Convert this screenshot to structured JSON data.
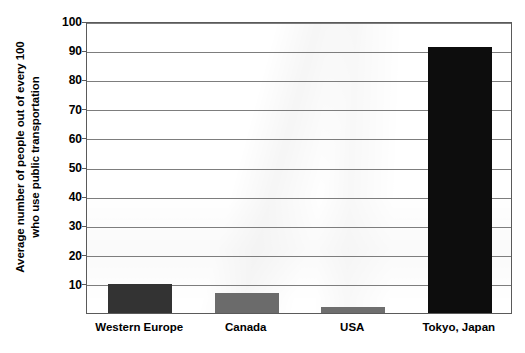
{
  "chart_data": {
    "type": "bar",
    "title": "",
    "subtitle": "",
    "xlabel": "",
    "ylabel_line1": "Average number of people out of every 100",
    "ylabel_line2": "who use public transportation",
    "categories": [
      "Western Europe",
      "Canada",
      "USA",
      "Tokyo, Japan"
    ],
    "values": [
      10,
      7,
      2,
      91
    ],
    "ylim": [
      0,
      100
    ],
    "ytick_values": [
      10,
      20,
      30,
      40,
      50,
      60,
      70,
      80,
      90,
      100
    ],
    "ytick_labels": [
      "10",
      "20",
      "30",
      "40",
      "50",
      "60",
      "70",
      "80",
      "90",
      "100"
    ],
    "grid": true,
    "legend": "none",
    "series": [
      {
        "name": "Public transportation use",
        "values": [
          10,
          7,
          2,
          91
        ]
      }
    ],
    "bar_colors": [
      "#333333",
      "#6b6b6b",
      "#6e6e6e",
      "#0d0d0d"
    ],
    "colors": {
      "background": "#ffffff",
      "axis": "#5a5a5a",
      "gridline": "#7d7d7d",
      "text": "#000000"
    }
  }
}
